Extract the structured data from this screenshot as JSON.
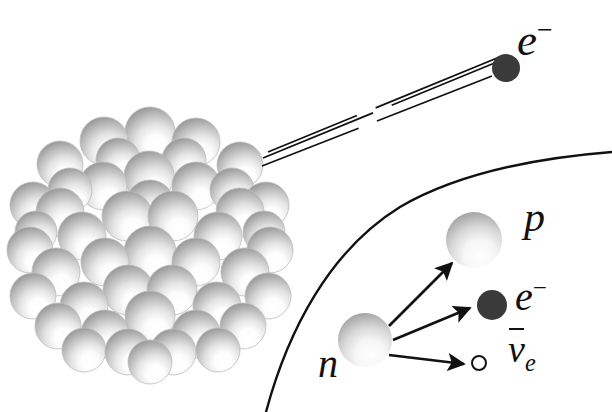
{
  "figure": {
    "background_color": "#ffffff",
    "width": 612,
    "height": 412
  },
  "colors": {
    "ink": "#111111",
    "electron_fill": "#3a3a3a",
    "nucleon_shadow": "#8d8d8d",
    "nucleon_dark": "#6f6f6f",
    "nucleon_light": "#ffffff",
    "nucleon_outline": "#bdbdbd"
  },
  "labels": {
    "electron_emitted": {
      "base": "e",
      "sup": "−",
      "name": "electron"
    },
    "proton": {
      "base": "p",
      "name": "proton"
    },
    "electron_inset": {
      "base": "e",
      "sup": "−",
      "name": "electron"
    },
    "antineutrino": {
      "base": "ν",
      "sub": "e",
      "overbar": true,
      "name": "electron antineutrino"
    },
    "neutron": {
      "base": "n",
      "name": "neutron"
    }
  },
  "nucleus": {
    "name": "atomic-nucleus",
    "center": [
      150,
      250
    ],
    "radius": 133,
    "nucleon_count": 46,
    "nucleon_radius": 24,
    "light_direction": "lower-right",
    "nucleons": [
      [
        150,
        132,
        25
      ],
      [
        104,
        141,
        24
      ],
      [
        196,
        142,
        24
      ],
      [
        60,
        164,
        23
      ],
      [
        240,
        165,
        23
      ],
      [
        149,
        176,
        25
      ],
      [
        103,
        186,
        24
      ],
      [
        196,
        186,
        24
      ],
      [
        33,
        205,
        23
      ],
      [
        266,
        205,
        23
      ],
      [
        60,
        212,
        24
      ],
      [
        240,
        212,
        24
      ],
      [
        127,
        216,
        25
      ],
      [
        173,
        216,
        25
      ],
      [
        82,
        236,
        24
      ],
      [
        218,
        236,
        24
      ],
      [
        30,
        250,
        23
      ],
      [
        270,
        250,
        23
      ],
      [
        150,
        252,
        26
      ],
      [
        105,
        262,
        24
      ],
      [
        196,
        262,
        24
      ],
      [
        56,
        272,
        24
      ],
      [
        245,
        272,
        24
      ],
      [
        128,
        290,
        25
      ],
      [
        172,
        290,
        25
      ],
      [
        33,
        296,
        23
      ],
      [
        268,
        296,
        23
      ],
      [
        84,
        306,
        24
      ],
      [
        217,
        306,
        24
      ],
      [
        150,
        316,
        25
      ],
      [
        58,
        326,
        23
      ],
      [
        243,
        326,
        23
      ],
      [
        105,
        334,
        24
      ],
      [
        196,
        334,
        24
      ],
      [
        128,
        352,
        23
      ],
      [
        173,
        352,
        23
      ],
      [
        150,
        362,
        22
      ],
      [
        84,
        350,
        22
      ],
      [
        218,
        350,
        22
      ],
      [
        264,
        232,
        21
      ],
      [
        36,
        232,
        21
      ],
      [
        70,
        190,
        22
      ],
      [
        232,
        190,
        22
      ],
      [
        150,
        204,
        24
      ],
      [
        118,
        160,
        22
      ],
      [
        184,
        160,
        22
      ]
    ]
  },
  "trajectory": {
    "name": "electron-trajectory",
    "description": "three near-parallel broken lines from nucleus surface to emitted electron",
    "lines": [
      {
        "x1": 262,
        "y1": 166,
        "x2": 492,
        "y2": 76,
        "gaps": [
          [
            0.42,
            0.5
          ]
        ]
      },
      {
        "x1": 263,
        "y1": 158,
        "x2": 497,
        "y2": 62,
        "gaps": [
          [
            0.47,
            0.55
          ]
        ]
      },
      {
        "x1": 268,
        "y1": 152,
        "x2": 502,
        "y2": 56,
        "gaps": [
          [
            0.38,
            0.46
          ]
        ]
      }
    ]
  },
  "emitted_electron": {
    "name": "emitted-electron",
    "center": [
      506,
      68
    ],
    "radius": 14
  },
  "inset": {
    "name": "nucleus-surface-inset",
    "boundary": {
      "name": "nucleus-surface-arc",
      "description": "curved arc representing the nuclear surface",
      "path": "M 266 412 C 288 330, 330 250, 400 207 C 460 172, 536 158, 612 152"
    },
    "neutron": {
      "name": "neutron-sphere",
      "center": [
        365,
        340
      ],
      "radius": 27
    },
    "proton": {
      "name": "proton-sphere",
      "center": [
        474,
        240
      ],
      "radius": 28
    },
    "electron": {
      "name": "inset-electron",
      "center": [
        492,
        305
      ],
      "radius": 15
    },
    "antineutrino": {
      "name": "inset-antineutrino",
      "center": [
        479,
        363
      ],
      "radius": 7
    },
    "arrows": [
      {
        "name": "arrow-to-proton",
        "x1": 389,
        "y1": 326,
        "x2": 452,
        "y2": 263
      },
      {
        "name": "arrow-to-electron",
        "x1": 393,
        "y1": 340,
        "x2": 470,
        "y2": 308
      },
      {
        "name": "arrow-to-antineutrino",
        "x1": 389,
        "y1": 355,
        "x2": 464,
        "y2": 364
      }
    ]
  },
  "caption_strip": {
    "name": "cropped-caption",
    "text": "",
    "visible": false
  }
}
